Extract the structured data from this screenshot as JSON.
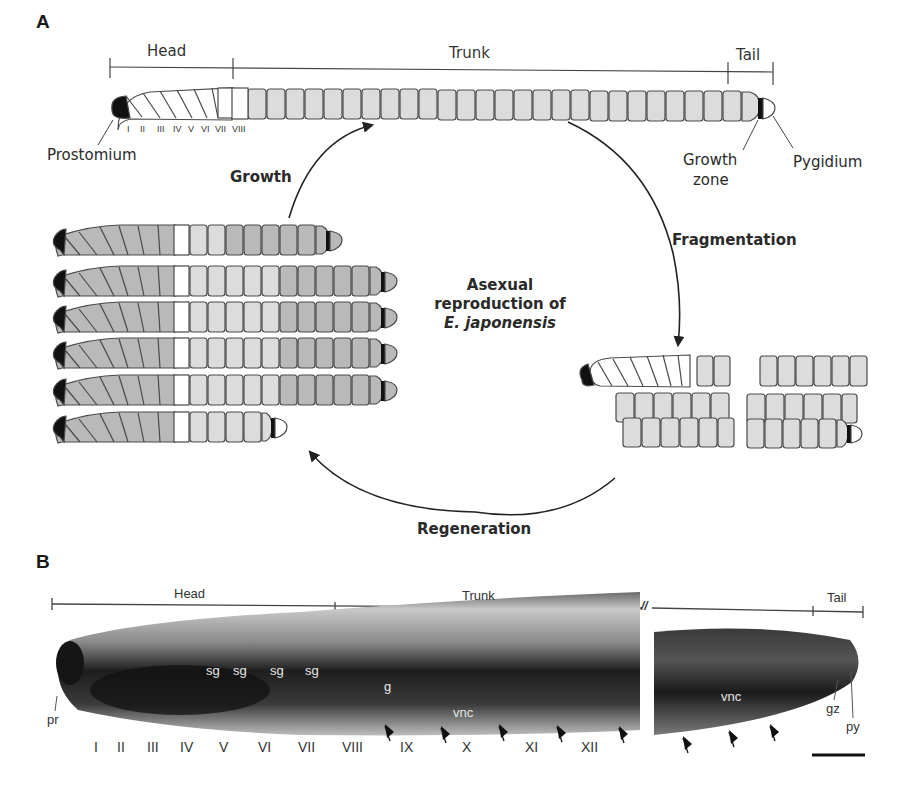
{
  "panel_a": {
    "letter": "A",
    "scale_labels": {
      "head": "Head",
      "trunk": "Trunk",
      "tail": "Tail"
    },
    "segment_numerals": [
      "I",
      "II",
      "III",
      "IV",
      "V",
      "VI",
      "VII",
      "VIII"
    ],
    "annotations": {
      "prostomium": "Prostomium",
      "growth_zone_line1": "Growth",
      "growth_zone_line2": "zone",
      "pygidium": "Pygidium"
    },
    "processes": {
      "growth": "Growth",
      "fragmentation": "Fragmentation",
      "regeneration": "Regeneration"
    },
    "center_title": {
      "line1": "Asexual",
      "line2": "reproduction of",
      "species": "E. japonensis"
    },
    "colors": {
      "head_segment": "#ffffff",
      "trunk_segment": "#dcdcdc",
      "dark_segment": "#b4b4b4",
      "outline": "#4a4a4a",
      "prostomium": "#111111"
    }
  },
  "panel_b": {
    "letter": "B",
    "scale_labels": {
      "head": "Head",
      "trunk": "Trunk",
      "tail": "Tail"
    },
    "break_mark": "//",
    "segment_numerals": [
      "I",
      "II",
      "III",
      "IV",
      "V",
      "VI",
      "VII",
      "VIII",
      "IX",
      "X",
      "XI",
      "XII"
    ],
    "labels": {
      "pr": "pr",
      "sg": "sg",
      "g": "g",
      "vnc": "vnc",
      "gz": "gz",
      "py": "py"
    }
  }
}
